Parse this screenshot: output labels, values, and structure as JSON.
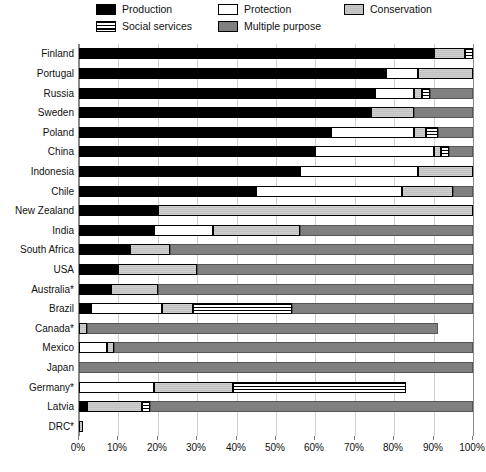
{
  "chart_data": {
    "type": "bar",
    "orientation": "horizontal",
    "stacked": true,
    "title": "",
    "xlabel": "",
    "ylabel": "",
    "xlim": [
      0,
      100
    ],
    "grid": true,
    "legend_position": "top",
    "units": "percent",
    "xticks": [
      "0%",
      "10%",
      "20%",
      "30%",
      "40%",
      "50%",
      "60%",
      "70%",
      "80%",
      "90%",
      "100%"
    ],
    "xtick_values": [
      0,
      10,
      20,
      30,
      40,
      50,
      60,
      70,
      80,
      90,
      100
    ],
    "series": [
      {
        "name": "Production",
        "key": "production",
        "color": "#000000"
      },
      {
        "name": "Social services",
        "key": "social",
        "color": "#ffffff"
      },
      {
        "name": "Protection",
        "key": "protection",
        "color": "#ffffff"
      },
      {
        "name": "Multiple purpose",
        "key": "multiple",
        "color": "#808080"
      },
      {
        "name": "Conservation",
        "key": "conservation",
        "color": "#c9c9c9"
      }
    ],
    "categories": [
      "Finland",
      "Portugal",
      "Russia",
      "Sweden",
      "Poland",
      "China",
      "Indonesia",
      "Chile",
      "New Zealand",
      "India",
      "South Africa",
      "USA",
      "Australia*",
      "Brazil",
      "Canada*",
      "Mexico",
      "Japan",
      "Germany*",
      "Latvia",
      "DRC*"
    ],
    "rows": [
      {
        "category": "Finland",
        "segments": [
          {
            "key": "production",
            "value": 90
          },
          {
            "key": "conservation",
            "value": 8
          },
          {
            "key": "social",
            "value": 2
          }
        ]
      },
      {
        "category": "Portugal",
        "segments": [
          {
            "key": "production",
            "value": 78
          },
          {
            "key": "protection",
            "value": 8
          },
          {
            "key": "conservation",
            "value": 14
          }
        ]
      },
      {
        "category": "Russia",
        "segments": [
          {
            "key": "production",
            "value": 75
          },
          {
            "key": "protection",
            "value": 10
          },
          {
            "key": "conservation",
            "value": 2
          },
          {
            "key": "social",
            "value": 2
          },
          {
            "key": "multiple",
            "value": 11
          }
        ]
      },
      {
        "category": "Sweden",
        "segments": [
          {
            "key": "production",
            "value": 74
          },
          {
            "key": "conservation",
            "value": 11
          },
          {
            "key": "multiple",
            "value": 15
          }
        ]
      },
      {
        "category": "Poland",
        "segments": [
          {
            "key": "production",
            "value": 64
          },
          {
            "key": "protection",
            "value": 21
          },
          {
            "key": "conservation",
            "value": 3
          },
          {
            "key": "social",
            "value": 3
          },
          {
            "key": "multiple",
            "value": 9
          }
        ]
      },
      {
        "category": "China",
        "segments": [
          {
            "key": "production",
            "value": 60
          },
          {
            "key": "protection",
            "value": 30
          },
          {
            "key": "conservation",
            "value": 2
          },
          {
            "key": "social",
            "value": 2
          },
          {
            "key": "multiple",
            "value": 6
          }
        ]
      },
      {
        "category": "Indonesia",
        "segments": [
          {
            "key": "production",
            "value": 56
          },
          {
            "key": "protection",
            "value": 30
          },
          {
            "key": "conservation",
            "value": 14
          }
        ]
      },
      {
        "category": "Chile",
        "segments": [
          {
            "key": "production",
            "value": 45
          },
          {
            "key": "protection",
            "value": 37
          },
          {
            "key": "conservation",
            "value": 13
          },
          {
            "key": "multiple",
            "value": 5
          }
        ]
      },
      {
        "category": "New Zealand",
        "segments": [
          {
            "key": "production",
            "value": 20
          },
          {
            "key": "conservation",
            "value": 80
          }
        ]
      },
      {
        "category": "India",
        "segments": [
          {
            "key": "production",
            "value": 19
          },
          {
            "key": "protection",
            "value": 15
          },
          {
            "key": "conservation",
            "value": 22
          },
          {
            "key": "multiple",
            "value": 44
          }
        ]
      },
      {
        "category": "South Africa",
        "segments": [
          {
            "key": "production",
            "value": 13
          },
          {
            "key": "conservation",
            "value": 10
          },
          {
            "key": "multiple",
            "value": 77
          }
        ]
      },
      {
        "category": "USA",
        "segments": [
          {
            "key": "production",
            "value": 10
          },
          {
            "key": "conservation",
            "value": 20
          },
          {
            "key": "multiple",
            "value": 70
          }
        ]
      },
      {
        "category": "Australia*",
        "segments": [
          {
            "key": "production",
            "value": 8
          },
          {
            "key": "conservation",
            "value": 12
          },
          {
            "key": "multiple",
            "value": 80
          }
        ]
      },
      {
        "category": "Brazil",
        "segments": [
          {
            "key": "production",
            "value": 3
          },
          {
            "key": "protection",
            "value": 18
          },
          {
            "key": "conservation",
            "value": 8
          },
          {
            "key": "social",
            "value": 25
          },
          {
            "key": "multiple",
            "value": 46
          }
        ]
      },
      {
        "category": "Canada*",
        "segments": [
          {
            "key": "conservation",
            "value": 2
          },
          {
            "key": "multiple",
            "value": 89
          }
        ]
      },
      {
        "category": "Mexico",
        "segments": [
          {
            "key": "protection",
            "value": 7
          },
          {
            "key": "conservation",
            "value": 2
          },
          {
            "key": "multiple",
            "value": 91
          }
        ]
      },
      {
        "category": "Japan",
        "segments": [
          {
            "key": "multiple",
            "value": 100
          }
        ]
      },
      {
        "category": "Germany*",
        "segments": [
          {
            "key": "protection",
            "value": 19
          },
          {
            "key": "conservation",
            "value": 20
          },
          {
            "key": "social",
            "value": 44
          }
        ]
      },
      {
        "category": "Latvia",
        "segments": [
          {
            "key": "production",
            "value": 2
          },
          {
            "key": "conservation",
            "value": 14
          },
          {
            "key": "social",
            "value": 2
          },
          {
            "key": "multiple",
            "value": 82
          }
        ]
      },
      {
        "category": "DRC*",
        "segments": [
          {
            "key": "conservation",
            "value": 1
          }
        ]
      }
    ]
  },
  "legend": {
    "items": [
      {
        "label": "Production",
        "swatch": "sw-production",
        "x": 96,
        "y": 4
      },
      {
        "label": "Social services",
        "swatch": "sw-social",
        "x": 96,
        "y": 21
      },
      {
        "label": "Protection",
        "swatch": "sw-protection",
        "x": 218,
        "y": 4
      },
      {
        "label": "Multiple purpose",
        "swatch": "sw-multiple",
        "x": 218,
        "y": 21
      },
      {
        "label": "Conservation",
        "swatch": "sw-conservation",
        "x": 344,
        "y": 4
      }
    ]
  }
}
